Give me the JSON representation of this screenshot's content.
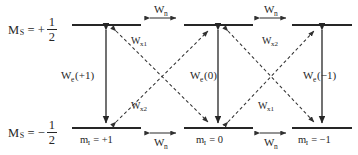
{
  "diagram": {
    "colors": {
      "line": "#262626",
      "text": "#262626",
      "background": "#ffffff"
    },
    "spin_axis_labels": [
      {
        "id": "ms-plus",
        "prefix": "M",
        "sub": "S",
        "eq": "= +",
        "numerator": "1",
        "denominator": "2"
      },
      {
        "id": "ms-minus",
        "prefix": "M",
        "sub": "S",
        "eq": "= −",
        "numerator": "1",
        "denominator": "2"
      }
    ],
    "upper_levels": [
      {
        "id": "upper-left"
      },
      {
        "id": "upper-middle"
      },
      {
        "id": "upper-right"
      }
    ],
    "lower_levels": [
      {
        "id": "lower-left"
      },
      {
        "id": "lower-middle"
      },
      {
        "id": "lower-right"
      }
    ],
    "mi_labels": [
      {
        "id": "mi-plus1",
        "text": "m",
        "sub": "I",
        "value": "= +1"
      },
      {
        "id": "mi-zero",
        "text": "m",
        "sub": "I",
        "value": "= 0"
      },
      {
        "id": "mi-minus1",
        "text": "m",
        "sub": "I",
        "value": "= −1"
      }
    ],
    "nuclear_transitions": [
      {
        "id": "wn-top-left",
        "text": "W",
        "sub": "n"
      },
      {
        "id": "wn-top-right",
        "text": "W",
        "sub": "n"
      },
      {
        "id": "wn-bottom-left",
        "text": "W",
        "sub": "n"
      },
      {
        "id": "wn-bottom-right",
        "text": "W",
        "sub": "n"
      }
    ],
    "electron_transitions": [
      {
        "id": "we-plus1",
        "text": "W",
        "sub": "e",
        "arg": "(+1)"
      },
      {
        "id": "we-zero",
        "text": "W",
        "sub": "e",
        "arg": "(0)"
      },
      {
        "id": "we-minus1",
        "text": "W",
        "sub": "e",
        "arg": "(−1)"
      }
    ],
    "cross_transitions": [
      {
        "id": "wx1-upper-left",
        "text": "W",
        "sub": "x1"
      },
      {
        "id": "wx2-upper-right",
        "text": "W",
        "sub": "x2"
      },
      {
        "id": "wx2-lower-left",
        "text": "W",
        "sub": "x2"
      },
      {
        "id": "wx1-lower-right",
        "text": "W",
        "sub": "x1"
      }
    ]
  }
}
